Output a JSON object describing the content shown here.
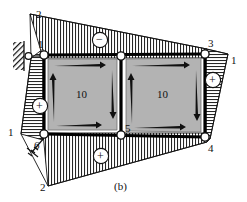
{
  "figure": {
    "caption": "(b)",
    "panels": [
      {
        "id": "left-panel",
        "label": "10"
      },
      {
        "id": "right-panel",
        "label": "10"
      }
    ],
    "node_labels": [
      {
        "name": "node-1",
        "text": "1"
      },
      {
        "name": "node-2-top",
        "text": "2"
      },
      {
        "name": "node-2-bottom",
        "text": "2"
      },
      {
        "name": "node-3",
        "text": "3"
      },
      {
        "name": "node-4",
        "text": "4"
      },
      {
        "name": "node-5",
        "text": "5"
      },
      {
        "name": "node-6",
        "text": "6"
      },
      {
        "name": "member-1-left",
        "text": "1"
      },
      {
        "name": "member-1-right",
        "text": "1"
      }
    ],
    "sign_markers": [
      {
        "name": "top-field-sign",
        "text": "−"
      },
      {
        "name": "left-field-sign",
        "text": "+"
      },
      {
        "name": "right-field-sign",
        "text": "+"
      },
      {
        "name": "bottom-field-sign",
        "text": "+"
      }
    ],
    "colors": {
      "panel_fill": "#b3b3b3",
      "panel_edge": "#111111",
      "hatch_line": "#222222",
      "outline": "#000000",
      "background": "#ffffff",
      "node_fill": "#ffffff"
    }
  }
}
